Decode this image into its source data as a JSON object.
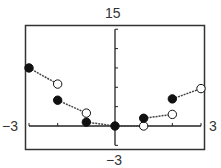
{
  "chart_data": {
    "type": "line",
    "title": "",
    "xlabel": "",
    "ylabel": "",
    "xlim": [
      -3,
      3
    ],
    "ylim": [
      -3,
      15
    ],
    "window_labels": {
      "ymax": "15",
      "ymin": "−3",
      "xmin": "−3",
      "xmax": "3"
    },
    "x_ticks": [
      -3,
      -2,
      -1,
      0,
      1,
      2,
      3
    ],
    "y_ticks": [
      -3,
      0,
      3,
      6,
      9,
      12,
      15
    ],
    "grid": false,
    "legend": null,
    "segments": [
      {
        "start": {
          "x": -3,
          "y": 9,
          "closed": true
        },
        "end": {
          "x": -2,
          "y": 6.5,
          "closed": false
        }
      },
      {
        "start": {
          "x": -2,
          "y": 4,
          "closed": true
        },
        "end": {
          "x": -1,
          "y": 2,
          "closed": false
        }
      },
      {
        "start": {
          "x": -1,
          "y": 0.6,
          "closed": true
        },
        "end": {
          "x": -0.15,
          "y": 0.1,
          "closed": false
        }
      },
      {
        "start": {
          "x": 0,
          "y": 0,
          "closed": true
        },
        "end": {
          "x": 1,
          "y": 0,
          "closed": false
        }
      },
      {
        "start": {
          "x": 1,
          "y": 1.2,
          "closed": true
        },
        "end": {
          "x": 2,
          "y": 1.8,
          "closed": false
        }
      },
      {
        "start": {
          "x": 2,
          "y": 4.2,
          "closed": true
        },
        "end": {
          "x": 3,
          "y": 5.8,
          "closed": false
        }
      }
    ]
  },
  "colors": {
    "frame": "#333333",
    "axis": "#222222",
    "point_fill": "#111111",
    "segment": "#444444"
  }
}
